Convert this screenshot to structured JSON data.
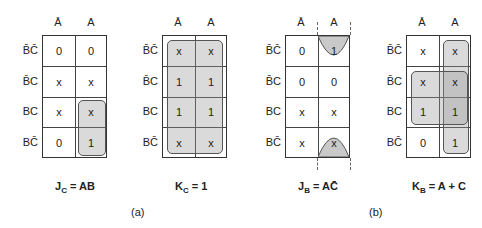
{
  "col_headers": [
    "Ā",
    "A"
  ],
  "row_headers": [
    "B̄C̄",
    "B̄C",
    "BC",
    "BC̄"
  ],
  "maps": [
    {
      "id": "jc",
      "cells": [
        [
          "0",
          "0"
        ],
        [
          "x",
          "x"
        ],
        [
          "x",
          "x"
        ],
        [
          "0",
          "1"
        ]
      ],
      "equation": {
        "lhs": "J",
        "sub": "C",
        "rhs": "= AB"
      }
    },
    {
      "id": "kc",
      "cells": [
        [
          "x",
          "x"
        ],
        [
          "1",
          "1"
        ],
        [
          "1",
          "1"
        ],
        [
          "x",
          "x"
        ]
      ],
      "equation": {
        "lhs": "K",
        "sub": "C",
        "rhs": "= 1"
      }
    },
    {
      "id": "jb",
      "cells": [
        [
          "0",
          "1"
        ],
        [
          "0",
          "0"
        ],
        [
          "x",
          "x"
        ],
        [
          "x",
          "x"
        ]
      ],
      "equation": {
        "lhs": "J",
        "sub": "B",
        "rhs": "= AC̄"
      }
    },
    {
      "id": "kb",
      "cells": [
        [
          "x",
          "x"
        ],
        [
          "x",
          "x"
        ],
        [
          "1",
          "1"
        ],
        [
          "0",
          "1"
        ]
      ],
      "equation": {
        "lhs": "K",
        "sub": "B",
        "rhs": "= A + C"
      }
    }
  ],
  "labels": {
    "a": "(a)",
    "b": "(b)"
  }
}
